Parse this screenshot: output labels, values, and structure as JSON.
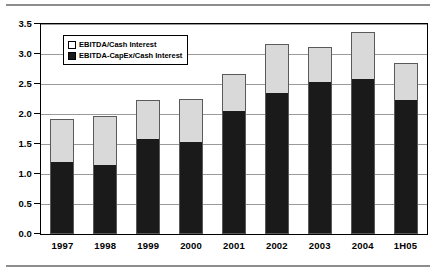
{
  "chart_data": {
    "type": "bar",
    "subtype": "stacked-bar",
    "title": "",
    "xlabel": "",
    "ylabel": "",
    "ylim": [
      0.0,
      3.5
    ],
    "ytick_labels": [
      "3.5",
      "3.0",
      "2.5",
      "2.0",
      "1.5",
      "1.0",
      "0.5",
      "0.0"
    ],
    "ytick_values": [
      3.5,
      3.0,
      2.5,
      2.0,
      1.5,
      1.0,
      0.5,
      0.0
    ],
    "grid": true,
    "grid_axis": "y",
    "legend_position": "upper-left-inside",
    "categories": [
      "1997",
      "1998",
      "1999",
      "2000",
      "2001",
      "2002",
      "2003",
      "2004",
      "1H05"
    ],
    "series": [
      {
        "name": "EBITDA-CapEx/Cash Interest",
        "color": "#1a1a1a",
        "swatch": "filled-black-square",
        "values": [
          1.19,
          1.13,
          1.57,
          1.52,
          2.03,
          2.34,
          2.51,
          2.56,
          2.22
        ]
      },
      {
        "name": "EBITDA/Cash Interest",
        "color": "#d9d9d9",
        "swatch": "open-white-square",
        "values": [
          1.91,
          1.96,
          2.23,
          2.25,
          2.67,
          3.16,
          3.11,
          3.37,
          2.85
        ]
      }
    ]
  },
  "legend": {
    "items": [
      {
        "label": "EBITDA/Cash Interest"
      },
      {
        "label": "EBITDA-CapEx/Cash Interest"
      }
    ]
  }
}
